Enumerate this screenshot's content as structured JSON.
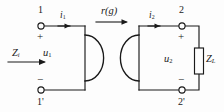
{
  "diagram": {
    "type": "circuit-schematic",
    "background_color": "#fdfdfd",
    "line_color": "#1a1a1a",
    "labels": {
      "terminal_1": "1",
      "terminal_1_prime": "1'",
      "terminal_2": "2",
      "terminal_2_prime": "2'",
      "current_1": "i",
      "current_1_sub": "1",
      "current_2": "i",
      "current_2_sub": "2",
      "voltage_1": "u",
      "voltage_1_sub": "1",
      "voltage_2": "u",
      "voltage_2_sub": "2",
      "input_impedance": "Z",
      "input_impedance_sub": "i",
      "load_impedance": "Z",
      "load_impedance_sub": "L",
      "gyration": "r(g)",
      "plus_left": "+",
      "minus_left": "−",
      "plus_right": "+",
      "minus_right": "−"
    },
    "elements": {
      "gyrator_symbol": "two facing semicircular arcs",
      "load_resistor": "vertical rectangle resistor box",
      "terminal_nodes": 4,
      "current_arrows": 2,
      "impedance_arrow": 1,
      "gyration_arrow": 1
    }
  }
}
